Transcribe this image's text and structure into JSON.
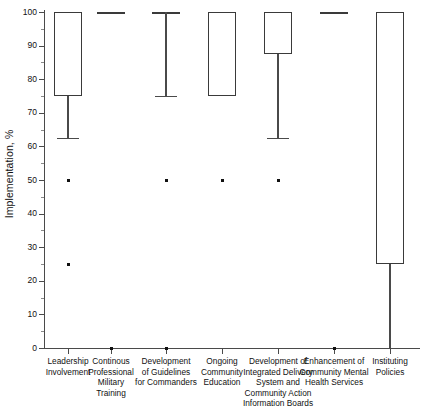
{
  "chart_data": {
    "type": "box",
    "title": "",
    "xlabel": "",
    "ylabel": "Implementation, %",
    "ylim": [
      0,
      100
    ],
    "ytick_labels": [
      "0",
      "10",
      "20",
      "30",
      "40",
      "50",
      "60",
      "70",
      "80",
      "90",
      "100"
    ],
    "ytick_values": [
      0,
      10,
      20,
      30,
      40,
      50,
      60,
      70,
      80,
      90,
      100
    ],
    "grid": false,
    "legend": "none",
    "categories": [
      "Leadership Involvement",
      "Continous Professional Military Training",
      "Development of Guidelines for Commanders",
      "Ongoing Community Education",
      "Development of Integrated Delivery System and Community Action Information Boards",
      "Enhancement of Community Mental Health Services",
      "Instituting Policies"
    ],
    "boxes": [
      {
        "category": "Leadership Involvement",
        "q1": 75,
        "median": 100,
        "q3": 100,
        "whisker_low": 62.5,
        "whisker_high": 100,
        "outliers": [
          50,
          25
        ]
      },
      {
        "category": "Continous Professional Military Training",
        "q1": 100,
        "median": 100,
        "q3": 100,
        "whisker_low": 100,
        "whisker_high": 100,
        "outliers": [
          0
        ]
      },
      {
        "category": "Development of Guidelines for Commanders",
        "q1": 100,
        "median": 100,
        "q3": 100,
        "whisker_low": 75,
        "whisker_high": 100,
        "outliers": [
          50,
          0
        ]
      },
      {
        "category": "Ongoing Community Education",
        "q1": 75,
        "median": 100,
        "q3": 100,
        "whisker_low": 75,
        "whisker_high": 100,
        "outliers": [
          50
        ]
      },
      {
        "category": "Development of Integrated Delivery System and Community Action Information Boards",
        "q1": 87.5,
        "median": 100,
        "q3": 100,
        "whisker_low": 62.5,
        "whisker_high": 100,
        "outliers": [
          50
        ]
      },
      {
        "category": "Enhancement of Community Mental Health Services",
        "q1": 100,
        "median": 100,
        "q3": 100,
        "whisker_low": 100,
        "whisker_high": 100,
        "outliers": [
          0
        ]
      },
      {
        "category": "Instituting Policies",
        "q1": 25,
        "median": 100,
        "q3": 100,
        "whisker_low": 0,
        "whisker_high": 100,
        "outliers": []
      }
    ],
    "category_label_lines": [
      [
        "Leadership",
        "Involvement"
      ],
      [
        "Continous",
        "Professional",
        "Military",
        "Training"
      ],
      [
        "Development",
        "of Guidelines",
        "for Commanders"
      ],
      [
        "Ongoing",
        "Community",
        "Education"
      ],
      [
        "Development of",
        "Integrated Delivery",
        "System and",
        "Community Action",
        "Information Boards"
      ],
      [
        "Enhancement of",
        "Community Mental",
        "Health Services"
      ],
      [
        "Instituting",
        "Policies"
      ]
    ],
    "colors": {
      "box_stroke": "#3a3a3a",
      "whisker": "#4a4a4a",
      "outlier": "#111111",
      "axis": "#4a4a4a",
      "text": "#111111",
      "background": "#ffffff"
    }
  }
}
